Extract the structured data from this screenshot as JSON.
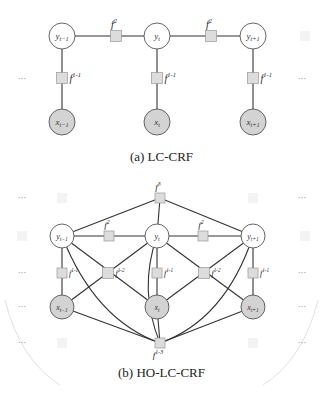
{
  "colors": {
    "hidden_node_fill": "#ffffff",
    "observed_node_fill": "#d3d3d3",
    "factor_fill": "#dcdcdc",
    "factor_stroke": "#999999",
    "edge": "#333333",
    "node_stroke": "#555555"
  },
  "diagram_a": {
    "caption": "(a) LC-CRF",
    "ellipsis": "···",
    "hidden_nodes": [
      {
        "label": "y",
        "sub": "t−1",
        "x": 62,
        "y": 36
      },
      {
        "label": "y",
        "sub": "t",
        "x": 157,
        "y": 36
      },
      {
        "label": "y",
        "sub": "t+1",
        "x": 253,
        "y": 36
      }
    ],
    "observed_nodes": [
      {
        "label": "x",
        "sub": "t−1",
        "x": 62,
        "y": 122
      },
      {
        "label": "x",
        "sub": "t",
        "x": 157,
        "y": 122
      },
      {
        "label": "x",
        "sub": "t+1",
        "x": 253,
        "y": 122
      }
    ],
    "pairwise_factors": [
      {
        "label": "f",
        "sup": "2",
        "x": 116,
        "y": 36
      },
      {
        "label": "f",
        "sup": "2",
        "x": 211,
        "y": 36
      }
    ],
    "unary_factors": [
      {
        "label": "f",
        "sup": "1-1",
        "x": 62,
        "y": 78
      },
      {
        "label": "f",
        "sup": "1-1",
        "x": 157,
        "y": 78
      },
      {
        "label": "f",
        "sup": "1-1",
        "x": 253,
        "y": 78
      }
    ]
  },
  "diagram_b": {
    "caption": "(b) HO-LC-CRF",
    "ellipsis": "···",
    "top_factor": {
      "label": "f",
      "sup": "3",
      "x": 160,
      "y": 198
    },
    "bottom_factor": {
      "label": "f",
      "sup": "1-3",
      "x": 160,
      "y": 343
    },
    "hidden_nodes": [
      {
        "label": "y",
        "sub": "t−1",
        "x": 62,
        "y": 236
      },
      {
        "label": "y",
        "sub": "t",
        "x": 157,
        "y": 236
      },
      {
        "label": "y",
        "sub": "t+1",
        "x": 253,
        "y": 236
      }
    ],
    "observed_nodes": [
      {
        "label": "x",
        "sub": "t−1",
        "x": 62,
        "y": 307
      },
      {
        "label": "x",
        "sub": "t",
        "x": 157,
        "y": 307
      },
      {
        "label": "x",
        "sub": "t+1",
        "x": 253,
        "y": 307
      }
    ],
    "pairwise_factors": [
      {
        "label": "f",
        "sup": "2",
        "x": 109,
        "y": 236
      },
      {
        "label": "f",
        "sup": "2",
        "x": 203,
        "y": 236
      }
    ],
    "unary_factors": [
      {
        "label": "f",
        "sup": "1-1",
        "x": 62,
        "y": 273
      },
      {
        "label": "f",
        "sup": "1-1",
        "x": 157,
        "y": 273
      },
      {
        "label": "f",
        "sup": "1-1",
        "x": 253,
        "y": 273
      }
    ],
    "cross_factors": [
      {
        "label": "f",
        "sup": "1-2",
        "x": 108,
        "y": 273
      },
      {
        "label": "f",
        "sup": "1-2",
        "x": 204,
        "y": 273
      }
    ]
  }
}
